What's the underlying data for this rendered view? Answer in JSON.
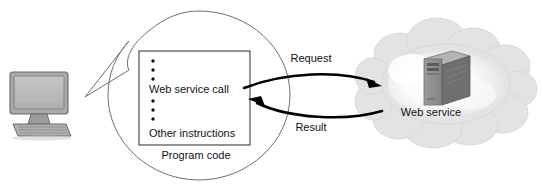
{
  "diagram": {
    "canvas": {
      "width": 543,
      "height": 190,
      "background": "#ffffff"
    },
    "client": {
      "icon_name": "desktop-computer-icon",
      "screen_color": "#b9b9b9",
      "bezel_color": "#9a9a9a",
      "keyboard_color": "#a8a8a8"
    },
    "callout": {
      "shape": "ellipse-with-pointer-tail",
      "outline_color": "#6e6e6e",
      "caption": "Program code",
      "code_box": {
        "border_color": "#2b2b2b",
        "fill": "#ffffff",
        "lines": [
          {
            "type": "bullet"
          },
          {
            "type": "bullet"
          },
          {
            "type": "bullet"
          },
          {
            "type": "text",
            "text": "Web service call"
          },
          {
            "type": "bullet"
          },
          {
            "type": "bullet"
          },
          {
            "type": "bullet"
          },
          {
            "type": "text",
            "text": "Other instructions"
          }
        ]
      }
    },
    "flows": [
      {
        "id": "request",
        "label": "Request",
        "direction": "client-to-service",
        "color": "#000000"
      },
      {
        "id": "result",
        "label": "Result",
        "direction": "service-to-client",
        "color": "#000000"
      }
    ],
    "cloud": {
      "icon_name": "cloud-icon",
      "label": "Web service",
      "fill": "#e4e4e4",
      "highlight": "#f7f7f7",
      "server": {
        "icon_name": "server-tower-icon",
        "front_color": "#8f8f8f",
        "side_color": "#6a6a6a",
        "top_color": "#b0b0b0"
      }
    }
  }
}
